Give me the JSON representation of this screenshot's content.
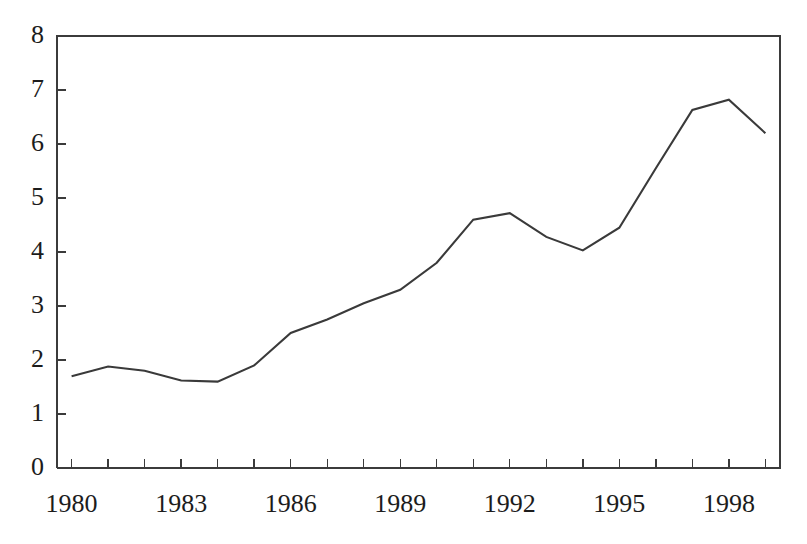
{
  "figure": {
    "top_caption_fragment": "",
    "background_color": "#ffffff",
    "line_color": "#3a3a3a",
    "axis_color": "#3b3b3b"
  },
  "chart_data": {
    "type": "line",
    "title": "",
    "subtitle": "",
    "xlabel": "",
    "ylabel": "",
    "x": [
      1980,
      1981,
      1982,
      1983,
      1984,
      1985,
      1986,
      1987,
      1988,
      1989,
      1990,
      1991,
      1992,
      1993,
      1994,
      1995,
      1996,
      1997,
      1998,
      1999
    ],
    "values": [
      1.7,
      1.88,
      1.8,
      1.62,
      1.6,
      1.9,
      2.5,
      2.75,
      3.05,
      3.3,
      3.8,
      4.6,
      4.72,
      4.28,
      4.03,
      4.45,
      5.55,
      6.63,
      6.82,
      6.2
    ],
    "series": [
      {
        "name": "series-1",
        "values": [
          1.7,
          1.88,
          1.8,
          1.62,
          1.6,
          1.9,
          2.5,
          2.75,
          3.05,
          3.3,
          3.8,
          4.6,
          4.72,
          4.28,
          4.03,
          4.45,
          5.55,
          6.63,
          6.82,
          6.2
        ]
      }
    ],
    "xlim": [
      1979.6,
      1999.4
    ],
    "ylim": [
      0,
      8
    ],
    "y_ticks": [
      0,
      1,
      2,
      3,
      4,
      5,
      6,
      7,
      8
    ],
    "y_tick_labels": [
      "0",
      "1",
      "2",
      "3",
      "4",
      "5",
      "6",
      "7",
      "8"
    ],
    "x_ticks": [
      1980,
      1981,
      1982,
      1983,
      1984,
      1985,
      1986,
      1987,
      1988,
      1989,
      1990,
      1991,
      1992,
      1993,
      1994,
      1995,
      1996,
      1997,
      1998,
      1999
    ],
    "x_tick_labels": [
      "1980",
      "",
      "",
      "1983",
      "",
      "",
      "1986",
      "",
      "",
      "1989",
      "",
      "",
      "1992",
      "",
      "",
      "1995",
      "",
      "",
      "1998",
      ""
    ],
    "x_labeled_ticks": [
      {
        "value": 1980,
        "label": "1980"
      },
      {
        "value": 1983,
        "label": "1983"
      },
      {
        "value": 1986,
        "label": "1986"
      },
      {
        "value": 1989,
        "label": "1989"
      },
      {
        "value": 1992,
        "label": "1992"
      },
      {
        "value": 1995,
        "label": "1995"
      },
      {
        "value": 1998,
        "label": "1998"
      }
    ],
    "grid": false,
    "legend": null,
    "legend_position": "none",
    "annotations": []
  }
}
